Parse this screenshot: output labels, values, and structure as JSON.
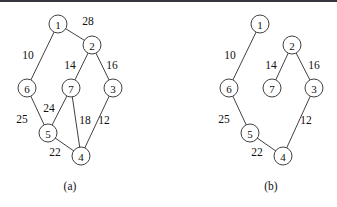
{
  "figure": {
    "background_color": "#ffffff",
    "line_color": "#2b2b2b",
    "text_color": "#111111",
    "top_rule_color": "#3a3640",
    "node_radius": 9
  },
  "chart_data": {
    "type": "diagram",
    "title": "",
    "subtitle": "",
    "xlabel": "",
    "ylabel": "",
    "grid": false,
    "legend": "none",
    "panels": [
      {
        "id": "a",
        "caption": "(a)",
        "caption_pos": {
          "x": 70,
          "y": 186
        },
        "description": "weighted undirected graph with 7 vertices and 9 edges",
        "nodes": [
          {
            "id": "1",
            "label": "1",
            "x": 58,
            "y": 24
          },
          {
            "id": "2",
            "label": "2",
            "x": 92,
            "y": 45
          },
          {
            "id": "3",
            "label": "3",
            "x": 113,
            "y": 88
          },
          {
            "id": "4",
            "label": "4",
            "x": 81,
            "y": 156
          },
          {
            "id": "5",
            "label": "5",
            "x": 48,
            "y": 133
          },
          {
            "id": "6",
            "label": "6",
            "x": 27,
            "y": 88
          },
          {
            "id": "7",
            "label": "7",
            "x": 71,
            "y": 88
          }
        ],
        "edges": [
          {
            "from": "1",
            "to": "2",
            "weight": "28",
            "label_x": 88,
            "label_y": 21
          },
          {
            "from": "1",
            "to": "6",
            "weight": "10",
            "label_x": 28,
            "label_y": 55
          },
          {
            "from": "2",
            "to": "7",
            "weight": "14",
            "label_x": 70,
            "label_y": 65
          },
          {
            "from": "2",
            "to": "3",
            "weight": "16",
            "label_x": 112,
            "label_y": 65
          },
          {
            "from": "6",
            "to": "5",
            "weight": "25",
            "label_x": 22,
            "label_y": 119
          },
          {
            "from": "7",
            "to": "5",
            "weight": "24",
            "label_x": 49,
            "label_y": 108
          },
          {
            "from": "7",
            "to": "4",
            "weight": "18",
            "label_x": 85,
            "label_y": 120
          },
          {
            "from": "3",
            "to": "4",
            "weight": "12",
            "label_x": 104,
            "label_y": 120
          },
          {
            "from": "5",
            "to": "4",
            "weight": "22",
            "label_x": 55,
            "label_y": 152
          }
        ]
      },
      {
        "id": "b",
        "caption": "(b)",
        "caption_pos": {
          "x": 271,
          "y": 186
        },
        "description": "minimum spanning tree of the graph in panel (a), 6 edges",
        "nodes": [
          {
            "id": "1",
            "label": "1",
            "x": 260,
            "y": 24
          },
          {
            "id": "2",
            "label": "2",
            "x": 292,
            "y": 45
          },
          {
            "id": "3",
            "label": "3",
            "x": 314,
            "y": 88
          },
          {
            "id": "4",
            "label": "4",
            "x": 283,
            "y": 156
          },
          {
            "id": "5",
            "label": "5",
            "x": 250,
            "y": 133
          },
          {
            "id": "6",
            "label": "6",
            "x": 229,
            "y": 88
          },
          {
            "id": "7",
            "label": "7",
            "x": 272,
            "y": 88
          }
        ],
        "edges": [
          {
            "from": "1",
            "to": "6",
            "weight": "10",
            "label_x": 230,
            "label_y": 55
          },
          {
            "from": "2",
            "to": "7",
            "weight": "14",
            "label_x": 271,
            "label_y": 65
          },
          {
            "from": "2",
            "to": "3",
            "weight": "16",
            "label_x": 314,
            "label_y": 65
          },
          {
            "from": "6",
            "to": "5",
            "weight": "25",
            "label_x": 224,
            "label_y": 119
          },
          {
            "from": "3",
            "to": "4",
            "weight": "12",
            "label_x": 306,
            "label_y": 120
          },
          {
            "from": "5",
            "to": "4",
            "weight": "22",
            "label_x": 257,
            "label_y": 152
          }
        ]
      }
    ]
  }
}
